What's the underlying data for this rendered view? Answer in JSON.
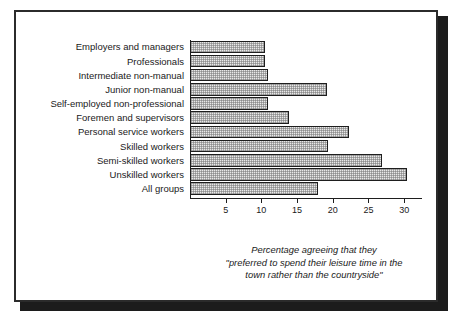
{
  "figure": {
    "frame_color": "#2b2b2b",
    "shadow_color": "#1c1c1c",
    "bar_fill": "#e8e8e8",
    "bar_outline": "#1e1e1e"
  },
  "caption": {
    "line1": "Percentage agreeing that they",
    "line2": "\"preferred to spend their leisure time in the",
    "line3": "town rather than the countryside\""
  },
  "chart_data": {
    "type": "bar",
    "orientation": "horizontal",
    "title": "",
    "xlabel": "",
    "ylabel": "",
    "xlim": [
      0,
      32.5
    ],
    "grid": false,
    "legend": null,
    "xticks": [
      5,
      10,
      15,
      20,
      25,
      30
    ],
    "xtick_labels": [
      "5",
      "10",
      "15",
      "20",
      "25",
      "30"
    ],
    "categories": [
      "Employers and managers",
      "Professionals",
      "Intermediate non-manual",
      "Junior non-manual",
      "Self-employed non-professional",
      "Foremen and supervisors",
      "Personal service workers",
      "Skilled workers",
      "Semi-skilled workers",
      "Unskilled workers",
      "All groups"
    ],
    "values": [
      10.2,
      10.2,
      10.6,
      18.6,
      10.6,
      13.4,
      21.5,
      18.7,
      26.0,
      29.4,
      17.3
    ]
  }
}
